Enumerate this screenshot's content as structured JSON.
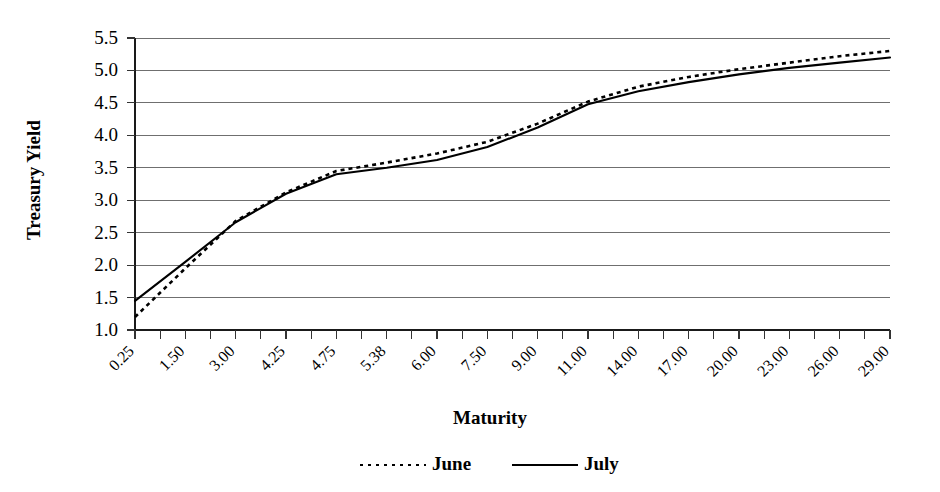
{
  "chart_data": {
    "type": "line",
    "title": "",
    "xlabel": "Maturity",
    "ylabel": "Treasury Yield",
    "categories": [
      "0.25",
      "1.50",
      "3.00",
      "4.25",
      "4.75",
      "5.38",
      "6.00",
      "7.50",
      "9.00",
      "11.00",
      "14.00",
      "17.00",
      "20.00",
      "23.00",
      "26.00",
      "29.00"
    ],
    "ylim": [
      1.0,
      5.5
    ],
    "yticks": [
      "1.0",
      "1.5",
      "2.0",
      "2.5",
      "3.0",
      "3.5",
      "4.0",
      "4.5",
      "5.0",
      "5.5"
    ],
    "grid": true,
    "legend_position": "bottom",
    "minor_ticks_per_category": 2,
    "series": [
      {
        "name": "June",
        "style": "dotted",
        "color": "#000000",
        "values": [
          1.2,
          1.95,
          2.68,
          3.12,
          3.45,
          3.58,
          3.72,
          3.9,
          4.18,
          4.52,
          4.75,
          4.9,
          5.02,
          5.12,
          5.22,
          5.3
        ]
      },
      {
        "name": "July",
        "style": "solid",
        "color": "#000000",
        "values": [
          1.45,
          2.05,
          2.66,
          3.1,
          3.4,
          3.5,
          3.62,
          3.82,
          4.12,
          4.48,
          4.68,
          4.82,
          4.94,
          5.04,
          5.12,
          5.2
        ]
      }
    ]
  },
  "legend": {
    "items": [
      {
        "label": "June",
        "style": "dotted"
      },
      {
        "label": "July",
        "style": "solid"
      }
    ]
  }
}
